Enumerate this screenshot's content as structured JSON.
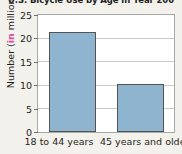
{
  "chart_data": {
    "type": "bar",
    "title": "U.S. Bicycle Use by Age in Year 200",
    "xlabel": "",
    "ylabel_prefix": "Number (",
    "ylabel_highlight": "in",
    "ylabel_suffix": " millions)",
    "ylabel_full": "Number (in millions)",
    "categories": [
      "18 to 44 years",
      "45 years and older"
    ],
    "values": [
      21.3,
      10.3
    ],
    "ylim": [
      0,
      25
    ],
    "yticks": [
      0,
      5,
      10,
      15,
      20,
      25
    ],
    "ytick_labels": [
      "0",
      "5",
      "10",
      "15",
      "20",
      "25"
    ],
    "grid": true,
    "legend": false,
    "bar_color": "#8eb4d0",
    "bar_edge_color": "#53534f",
    "plot_background": "#ffffff",
    "figure_background": "#f3f1ec",
    "highlight_color": "#d94f9a"
  }
}
